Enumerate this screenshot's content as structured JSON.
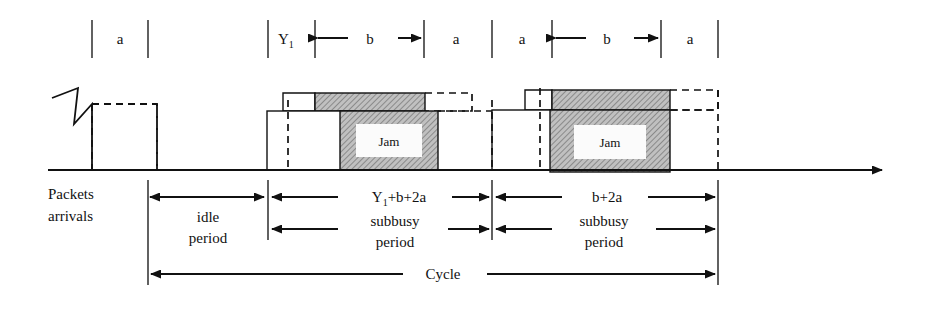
{
  "figure": {
    "colors": {
      "ink": "#111111",
      "hatch_fill": "#b8b8b8",
      "hatch_stroke": "#6f6f6f",
      "paper": "#ffffff"
    }
  },
  "top_scale": {
    "segments": [
      {
        "id": "seg-a-1",
        "label": "a",
        "arrows": "none"
      },
      {
        "id": "seg-y1",
        "label": "Y₁",
        "arrows": "none"
      },
      {
        "id": "seg-b-1",
        "label": "b",
        "arrows": "both-inward"
      },
      {
        "id": "seg-a-2",
        "label": "a",
        "arrows": "none"
      },
      {
        "id": "seg-a-3",
        "label": "a",
        "arrows": "none"
      },
      {
        "id": "seg-b-2",
        "label": "b",
        "arrows": "both-inward"
      },
      {
        "id": "seg-a-4",
        "label": "a",
        "arrows": "none"
      }
    ],
    "label_a": "a",
    "label_b": "b",
    "label_y1_base": "Y",
    "label_y1_sub": "1"
  },
  "timeline": {
    "axis_label": "time-axis",
    "arrival_symbol": "packet-arrival-zigzag"
  },
  "transmissions": [
    {
      "id": "burst-1",
      "jam_label": "Jam"
    },
    {
      "id": "burst-2",
      "jam_label": "Jam"
    }
  ],
  "annotations": {
    "packets_arrivals_line1": "Packets",
    "packets_arrivals_line2": "arrivals",
    "idle_line1": "idle",
    "idle_line2": "period",
    "subbusy1_line1": "subbusy",
    "subbusy1_line2": "period",
    "subbusy2_line1": "subbusy",
    "subbusy2_line2": "period",
    "duration_1": "Y₁+b+2a",
    "duration_1_base": "Y",
    "duration_1_sub": "1",
    "duration_1_rest": "+b+2a",
    "duration_2": "b+2a",
    "cycle": "Cycle"
  }
}
